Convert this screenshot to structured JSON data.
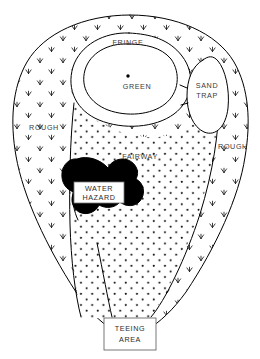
{
  "diagram": {
    "background_color": "#ffffff",
    "line_color": "#000000",
    "hazard_color": "#000000",
    "label_color": "#3a3a3a",
    "labels": {
      "fringe": "FRINGE",
      "green": "GREEN",
      "sand_trap_line1": "SAND",
      "sand_trap_line2": "TRAP",
      "rough_left": "ROUGH",
      "rough_right": "ROUGH",
      "fairway": "FAIRWAY",
      "water_hazard_line1": "WATER",
      "water_hazard_line2": "HAZARD",
      "teeing_area_line1": "TEEING",
      "teeing_area_line2": "AREA"
    },
    "regions": [
      {
        "name": "rough",
        "label": "ROUGH",
        "texture": "grass-tufts",
        "fill": "#ffffff"
      },
      {
        "name": "fairway",
        "label": "FAIRWAY",
        "texture": "dot-grid",
        "fill": "#ffffff"
      },
      {
        "name": "green",
        "label": "GREEN",
        "texture": "none",
        "fill": "#ffffff"
      },
      {
        "name": "fringe",
        "label": "FRINGE",
        "texture": "none",
        "fill": "#ffffff"
      },
      {
        "name": "sand-trap",
        "label": "SAND TRAP",
        "texture": "none",
        "fill": "#ffffff"
      },
      {
        "name": "water-hazard",
        "label": "WATER HAZARD",
        "texture": "solid",
        "fill": "#000000"
      },
      {
        "name": "teeing-area",
        "label": "TEEING AREA",
        "texture": "none",
        "fill": "#ffffff"
      }
    ],
    "pin": {
      "name": "pin-marker",
      "x": 128,
      "y": 76
    }
  }
}
